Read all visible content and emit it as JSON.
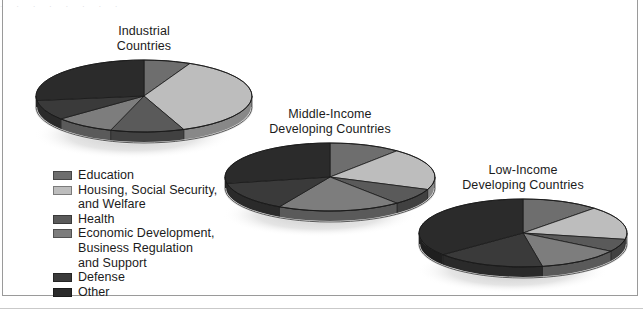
{
  "figure": {
    "background": "#ffffff",
    "frame_color": "#9a9a9a",
    "top_cut_text": ". . . . . . . ."
  },
  "legend": {
    "items": [
      {
        "label": "Education",
        "color": "#6e6e6e"
      },
      {
        "label": "Housing, Social Security,\nand Welfare",
        "color": "#bdbdbd"
      },
      {
        "label": "Health",
        "color": "#5a5a5a"
      },
      {
        "label": "Economic Development,\nBusiness Regulation\nand Support",
        "color": "#7d7d7d"
      },
      {
        "label": "Defense",
        "color": "#3a3a3a"
      },
      {
        "label": "Other",
        "color": "#2b2b2b"
      }
    ]
  },
  "chart_data": {
    "type": "pie",
    "legend_position": "bottom-left",
    "categories": [
      "Education",
      "Housing, Social Security, and Welfare",
      "Health",
      "Economic Development, Business Regulation and Support",
      "Defense",
      "Other"
    ],
    "colors": [
      "#6e6e6e",
      "#bdbdbd",
      "#5a5a5a",
      "#7d7d7d",
      "#3a3a3a",
      "#2b2b2b"
    ],
    "charts": [
      {
        "name": "industrial",
        "title": "Industrial\nCountries",
        "title_line1": "Industrial",
        "title_line2": "Countries",
        "values": [
          7,
          37,
          11,
          9,
          9,
          27
        ],
        "cx": 144,
        "cy": 96,
        "rx": 108,
        "ry": 36,
        "depth": 11,
        "start_angle": 270
      },
      {
        "name": "middle-income",
        "title": "Middle-Income\nDeveloping Countries",
        "title_line1": "Middle-Income",
        "title_line2": "Developing Countries",
        "values": [
          11,
          20,
          8,
          19,
          14,
          28
        ],
        "cx": 330,
        "cy": 177,
        "rx": 105,
        "ry": 34,
        "depth": 11,
        "start_angle": 270
      },
      {
        "name": "low-income",
        "title": "Low-Income\nDeveloping Countries",
        "title_line1": "Low-Income",
        "title_line2": "Developing Countries",
        "values": [
          12,
          16,
          6,
          13,
          17,
          36
        ],
        "cx": 523,
        "cy": 233,
        "rx": 104,
        "ry": 34,
        "depth": 11,
        "start_angle": 270
      }
    ]
  }
}
